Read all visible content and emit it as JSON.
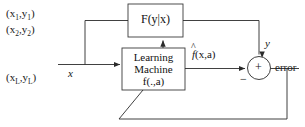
{
  "diagram": {
    "colors": {
      "line": "#2b2b2b",
      "box_border": "#3a3a3a",
      "text": "#151515",
      "background": "#ffffff"
    },
    "training_samples": {
      "name": "training-data-list",
      "items": [
        {
          "x": "x",
          "x_sub": "1",
          "y": "y",
          "y_sub": "1"
        },
        {
          "x": "x",
          "x_sub": "2",
          "y": "y",
          "y_sub": "2"
        },
        {
          "x": "x",
          "x_sub": "L",
          "y": "y",
          "y_sub": "L"
        }
      ]
    },
    "blocks": {
      "generator": {
        "label": "F(y|x)",
        "lines": [
          "F(y|x)"
        ]
      },
      "learning_machine": {
        "lines": [
          "Learning",
          "Machine",
          "f(.,a)"
        ]
      },
      "summing_junction": {
        "plus": "+",
        "minus": "−"
      }
    },
    "signals": {
      "input": "x",
      "supervisor_output": "y",
      "machine_output_f": "f",
      "machine_output_args": "(x,a)",
      "error": "error"
    }
  }
}
